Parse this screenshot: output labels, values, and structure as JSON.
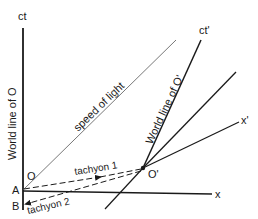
{
  "diagram": {
    "type": "spacetime (Minkowski) diagram",
    "axes": {
      "time_axis_O": {
        "label": "ct"
      },
      "space_axis_O": {
        "label": "x"
      },
      "time_axis_O_prime": {
        "label": "ct'"
      },
      "space_axis_O_prime": {
        "label": "x'"
      }
    },
    "lines": {
      "world_line_O": {
        "label": "World line of O"
      },
      "world_line_O_prime": {
        "label": "World line of O'"
      },
      "light_line": {
        "label": "speed of light"
      },
      "tachyon_1": {
        "label": "tachyon 1",
        "style": "dashed",
        "direction": "A to O'"
      },
      "tachyon_2": {
        "label": "tachyon 2",
        "style": "dashed",
        "direction": "O' to B"
      }
    },
    "points": {
      "O": {
        "label": "O"
      },
      "O_prime": {
        "label": "O'"
      },
      "A": {
        "label": "A"
      },
      "B": {
        "label": "B"
      }
    },
    "colors": {
      "ink": "#1a1a1a",
      "light_line": "#555555",
      "background": "#ffffff"
    }
  }
}
